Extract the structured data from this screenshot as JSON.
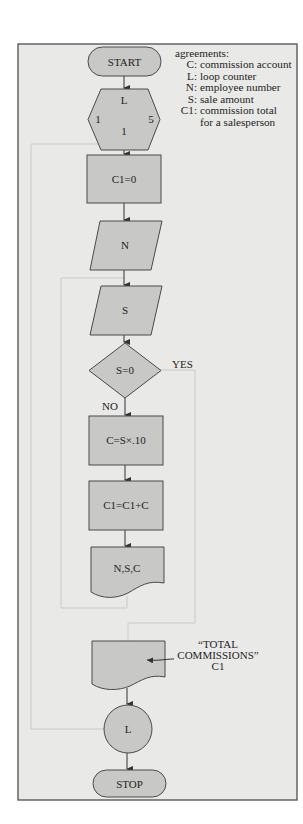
{
  "diagram": {
    "type": "flowchart",
    "colors": {
      "frame_background": "#e9e9e7",
      "shape_fill": "#c8c8c6",
      "outline": "#4a4a4a",
      "loop_line": "#c9c9c9"
    },
    "legend": {
      "heading": "agreements:",
      "entries": [
        {
          "key": "C:",
          "value": "commission account"
        },
        {
          "key": "L:",
          "value": "loop counter"
        },
        {
          "key": "N:",
          "value": "employee number"
        },
        {
          "key": "S:",
          "value": "sale amount"
        },
        {
          "key": "C1:",
          "value": "commission total"
        },
        {
          "key": "",
          "value": "for a salesperson"
        }
      ]
    },
    "nodes": {
      "start": {
        "shape": "terminal",
        "label": "START"
      },
      "loop_start": {
        "shape": "hexagon",
        "label": "L",
        "from": "1",
        "to": "5",
        "step": "1"
      },
      "init": {
        "shape": "process",
        "label": "C1=0"
      },
      "input_n": {
        "shape": "input",
        "label": "N"
      },
      "input_s": {
        "shape": "input",
        "label": "S"
      },
      "decision": {
        "shape": "decision",
        "label": "S=0",
        "yes_label": "YES",
        "no_label": "NO"
      },
      "calc_c": {
        "shape": "process",
        "label": "C=S×.10"
      },
      "accumulate": {
        "shape": "process",
        "label": "C1=C1+C"
      },
      "output_nsc": {
        "shape": "document",
        "label": "N,S,C"
      },
      "output_total": {
        "shape": "document",
        "annotation_line1": "“TOTAL",
        "annotation_line2": "COMMISSIONS”",
        "annotation_line3": "C1"
      },
      "loop_end": {
        "shape": "connector",
        "label": "L"
      },
      "stop": {
        "shape": "terminal",
        "label": "STOP"
      }
    }
  }
}
